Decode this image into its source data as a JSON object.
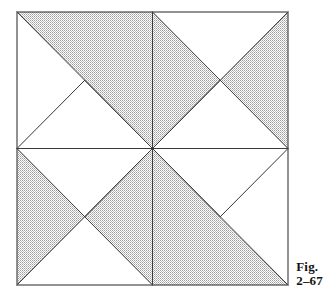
{
  "figure": {
    "caption_line1": "Fig.",
    "caption_line2": "2–67",
    "alt_label": "Eight-sector pinwheel square with shaded halftone regions",
    "colors": {
      "line": "#3a3a3a",
      "border": "#4a4a4a",
      "shade_fill": "#cfcfcf",
      "background": "#ffffff",
      "caption_text": "#141414"
    },
    "geometry": {
      "square": {
        "x": 17,
        "y": 12,
        "width": 271,
        "height": 273
      },
      "center": {
        "x": 152.5,
        "y": 148.5
      },
      "corners": {
        "top_left": [
          17,
          12
        ],
        "top_right": [
          288,
          12
        ],
        "bottom_right": [
          288,
          285
        ],
        "bottom_left": [
          17,
          285
        ]
      },
      "edge_midpoints": {
        "top": [
          152.5,
          12
        ],
        "right": [
          288,
          148.5
        ],
        "bottom": [
          152.5,
          285
        ],
        "left": [
          17,
          148.5
        ]
      },
      "quadrant_centers": {
        "top_left": [
          84.75,
          80.25
        ],
        "top_right": [
          220.25,
          80.25
        ],
        "bottom_left": [
          84.75,
          216.75
        ],
        "bottom_right": [
          220.25,
          216.75
        ]
      }
    },
    "shaded_polygons": [
      {
        "name": "upper-band-shaded",
        "points": "17,12 288,12 288,148.5 220.25,80.25 152.5,148.5 84.75,80.25 17,148.5"
      },
      {
        "name": "lower-band-shaded",
        "points": "288,285 17,285 17,148.5 84.75,216.75 152.5,148.5 220.25,216.75 288,148.5"
      }
    ],
    "white_triangles": [
      {
        "name": "white-triangle-top-left",
        "points": "17,12 84.75,80.25 17,148.5"
      },
      {
        "name": "white-triangle-top-right",
        "points": "152.5,12 288,12 220.25,80.25"
      },
      {
        "name": "white-triangle-bottom-right",
        "points": "288,285 220.25,216.75 288,148.5"
      },
      {
        "name": "white-triangle-bottom-left",
        "points": "17,285 152.5,285 84.75,216.75"
      }
    ],
    "lines": [
      {
        "name": "line-vertical-axis",
        "x1": 152.5,
        "y1": 12,
        "x2": 152.5,
        "y2": 285
      },
      {
        "name": "line-horizontal-axis",
        "x1": 17,
        "y1": 148.5,
        "x2": 288,
        "y2": 148.5
      },
      {
        "name": "line-diagonal-tl-br",
        "x1": 17,
        "y1": 12,
        "x2": 288,
        "y2": 285
      },
      {
        "name": "line-diagonal-tr-bl",
        "x1": 288,
        "y1": 12,
        "x2": 17,
        "y2": 285
      },
      {
        "name": "line-fold-left-to-quadrant-tl",
        "x1": 17,
        "y1": 148.5,
        "x2": 84.75,
        "y2": 80.25
      },
      {
        "name": "line-fold-quadrant-tl-to-center",
        "x1": 84.75,
        "y1": 80.25,
        "x2": 152.5,
        "y2": 148.5
      },
      {
        "name": "line-fold-top-to-quadrant-tr",
        "x1": 152.5,
        "y1": 12,
        "x2": 220.25,
        "y2": 80.25
      },
      {
        "name": "line-fold-quadrant-tr-to-right",
        "x1": 220.25,
        "y1": 80.25,
        "x2": 288,
        "y2": 148.5
      },
      {
        "name": "line-fold-center-to-quadrant-tr",
        "x1": 152.5,
        "y1": 148.5,
        "x2": 220.25,
        "y2": 80.25
      },
      {
        "name": "line-fold-right-to-quadrant-br",
        "x1": 288,
        "y1": 148.5,
        "x2": 220.25,
        "y2": 216.75
      },
      {
        "name": "line-fold-quadrant-br-to-center",
        "x1": 220.25,
        "y1": 216.75,
        "x2": 152.5,
        "y2": 148.5
      },
      {
        "name": "line-fold-bottom-to-quadrant-bl",
        "x1": 152.5,
        "y1": 285,
        "x2": 84.75,
        "y2": 216.75
      },
      {
        "name": "line-fold-quadrant-bl-to-left",
        "x1": 84.75,
        "y1": 216.75,
        "x2": 17,
        "y2": 148.5
      },
      {
        "name": "line-fold-center-to-quadrant-bl",
        "x1": 152.5,
        "y1": 148.5,
        "x2": 84.75,
        "y2": 216.75
      }
    ]
  }
}
